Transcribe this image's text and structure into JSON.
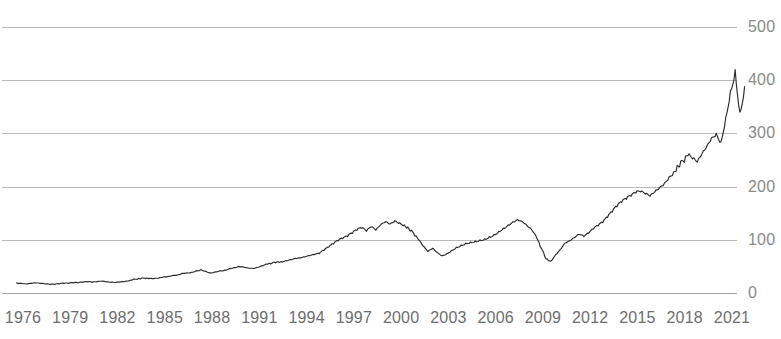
{
  "chart_data": {
    "type": "line",
    "title": "",
    "subtitle": "",
    "xlabel": "",
    "ylabel": "",
    "xlim": [
      1975.3,
      2021.9
    ],
    "ylim": [
      0,
      500
    ],
    "grid": true,
    "legend": null,
    "y_ticks": [
      "0",
      "100",
      "200",
      "300",
      "400",
      "500"
    ],
    "y_tick_values": [
      0,
      100,
      200,
      300,
      400,
      500
    ],
    "x_ticks": [
      "1976",
      "1979",
      "1982",
      "1985",
      "1988",
      "1991",
      "1994",
      "1997",
      "2000",
      "2003",
      "2006",
      "2009",
      "2012",
      "2015",
      "2018",
      "2021"
    ],
    "x_tick_values": [
      1976,
      1979,
      1982,
      1985,
      1988,
      1991,
      1994,
      1997,
      2000,
      2003,
      2006,
      2009,
      2012,
      2015,
      2018,
      2021
    ],
    "series": [
      {
        "name": "index",
        "color": "#2b2b2b",
        "x": [
          1975.6,
          1975.9,
          1976.2,
          1976.5,
          1976.8,
          1977.1,
          1977.4,
          1977.7,
          1978.0,
          1978.3,
          1978.6,
          1978.9,
          1979.2,
          1979.5,
          1979.8,
          1980.1,
          1980.4,
          1980.7,
          1981.0,
          1981.3,
          1981.6,
          1981.9,
          1982.2,
          1982.5,
          1982.8,
          1983.1,
          1983.4,
          1983.7,
          1984.0,
          1984.3,
          1984.6,
          1984.9,
          1985.2,
          1985.5,
          1985.8,
          1986.1,
          1986.4,
          1986.7,
          1987.0,
          1987.3,
          1987.6,
          1987.9,
          1988.2,
          1988.5,
          1988.8,
          1989.1,
          1989.4,
          1989.7,
          1990.0,
          1990.3,
          1990.6,
          1990.9,
          1991.2,
          1991.5,
          1991.8,
          1992.1,
          1992.4,
          1992.7,
          1993.0,
          1993.3,
          1993.6,
          1993.9,
          1994.2,
          1994.5,
          1994.8,
          1995.1,
          1995.4,
          1995.7,
          1996.0,
          1996.3,
          1996.6,
          1996.9,
          1997.2,
          1997.5,
          1997.8,
          1998.1,
          1998.4,
          1998.7,
          1999.0,
          1999.3,
          1999.6,
          1999.9,
          2000.2,
          2000.5,
          2000.8,
          2001.1,
          2001.4,
          2001.7,
          2002.0,
          2002.3,
          2002.6,
          2002.9,
          2003.2,
          2003.5,
          2003.8,
          2004.1,
          2004.4,
          2004.7,
          2005.0,
          2005.3,
          2005.6,
          2005.9,
          2006.2,
          2006.5,
          2006.8,
          2007.1,
          2007.4,
          2007.7,
          2008.0,
          2008.3,
          2008.6,
          2008.9,
          2009.2,
          2009.5,
          2009.8,
          2010.1,
          2010.4,
          2010.7,
          2011.0,
          2011.3,
          2011.6,
          2011.9,
          2012.2,
          2012.5,
          2012.8,
          2013.1,
          2013.4,
          2013.7,
          2014.0,
          2014.3,
          2014.6,
          2014.9,
          2015.2,
          2015.5,
          2015.8,
          2016.1,
          2016.4,
          2016.7,
          2017.0,
          2017.3,
          2017.6,
          2017.9,
          2018.2,
          2018.5,
          2018.8,
          2019.1,
          2019.4,
          2019.7,
          2020.0,
          2020.3,
          2020.6,
          2020.9,
          2021.2,
          2021.5,
          2021.8
        ],
        "y": [
          19,
          18,
          17,
          18,
          19,
          18,
          17,
          16,
          16,
          17,
          18,
          18,
          19,
          19,
          20,
          21,
          20,
          21,
          22,
          21,
          20,
          20,
          21,
          22,
          24,
          26,
          27,
          28,
          27,
          27,
          28,
          30,
          31,
          33,
          34,
          37,
          38,
          39,
          42,
          44,
          41,
          38,
          40,
          42,
          43,
          46,
          48,
          50,
          49,
          47,
          46,
          48,
          51,
          54,
          56,
          58,
          59,
          61,
          63,
          65,
          66,
          68,
          70,
          72,
          74,
          80,
          86,
          92,
          98,
          102,
          106,
          112,
          118,
          122,
          116,
          124,
          118,
          128,
          134,
          130,
          136,
          132,
          128,
          120,
          112,
          100,
          88,
          78,
          84,
          76,
          70,
          74,
          80,
          86,
          90,
          94,
          96,
          98,
          100,
          102,
          106,
          110,
          116,
          122,
          128,
          134,
          138,
          134,
          126,
          118,
          104,
          84,
          64,
          60,
          72,
          82,
          94,
          98,
          104,
          110,
          106,
          112,
          120,
          126,
          132,
          142,
          152,
          162,
          170,
          176,
          182,
          188,
          190,
          186,
          182,
          190,
          198,
          206,
          218,
          228,
          238,
          248,
          258,
          252,
          246,
          262,
          276,
          292,
          300,
          284,
          330,
          380,
          420,
          340,
          388
        ]
      }
    ]
  }
}
